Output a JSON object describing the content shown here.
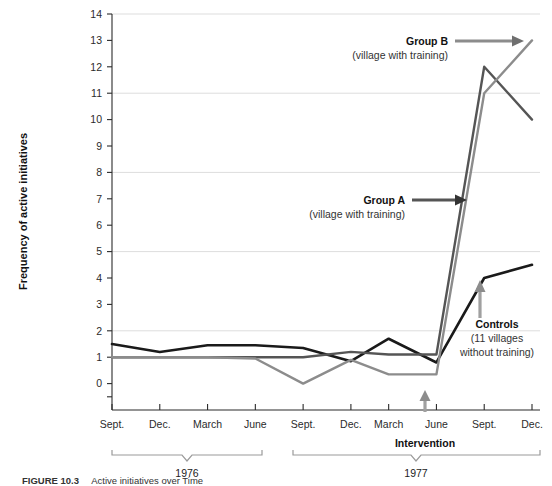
{
  "chart_data": {
    "type": "line",
    "title": "",
    "xlabel": "",
    "ylabel": "Frequency of active initiatives",
    "ylim": [
      -1,
      14
    ],
    "yticks": [
      0,
      1,
      2,
      3,
      4,
      5,
      6,
      7,
      8,
      9,
      10,
      11,
      12,
      13,
      14
    ],
    "gridlines": [
      2,
      5,
      8,
      11,
      14
    ],
    "grid": true,
    "legend_position": "annotations-inline",
    "categories": [
      "Sept.",
      "Dec.",
      "March",
      "June",
      "Sept.",
      "Dec.",
      "March",
      "June",
      "Sept.",
      "Dec."
    ],
    "period_groups": [
      {
        "label": "1976",
        "from_index": 0,
        "to_index": 5
      },
      {
        "label": "1977",
        "from_index": 6,
        "to_index": 9
      }
    ],
    "series": [
      {
        "name": "Controls",
        "sublabel": "(11 villages without training)",
        "color": "#1a1a1a",
        "values": [
          1.5,
          1.2,
          1.45,
          1.45,
          1.35,
          0.85,
          1.7,
          0.8,
          4.0,
          4.5
        ]
      },
      {
        "name": "Group A",
        "sublabel": "(village with training)",
        "color": "#555555",
        "values": [
          1.0,
          1.0,
          1.0,
          1.0,
          1.0,
          1.2,
          1.1,
          1.1,
          12.0,
          10.0
        ]
      },
      {
        "name": "Group B",
        "sublabel": "(village with training)",
        "color": "#8c8c8c",
        "values": [
          1.0,
          1.0,
          1.0,
          0.95,
          0.0,
          0.9,
          0.35,
          0.35,
          11.0,
          13.0
        ]
      }
    ],
    "annotations": [
      {
        "name": "Group B",
        "sub": "(village with training)",
        "arrow": "right",
        "color": "#8c8c8c"
      },
      {
        "name": "Group A",
        "sub": "(village with training)",
        "arrow": "right",
        "color": "#333333"
      },
      {
        "name": "Controls",
        "sub_line1": "(11 villages",
        "sub_line2": "without training)",
        "arrow": "up",
        "color": "#8c8c8c"
      },
      {
        "name": "Intervention",
        "arrow": "up",
        "color": "#8c8c8c",
        "at_index": 7.5
      }
    ]
  },
  "axis": {
    "y_title": "Frequency of active initiatives",
    "y_tick_labels": [
      "14",
      "13",
      "12",
      "11",
      "10",
      "9",
      "8",
      "7",
      "6",
      "5",
      "4",
      "3",
      "2",
      "1",
      "0"
    ],
    "x_tick_labels": [
      "Sept.",
      "Dec.",
      "March",
      "June",
      "Sept.",
      "Dec.",
      "March",
      "June",
      "Sept.",
      "Dec."
    ]
  },
  "annotations": {
    "group_b": {
      "title": "Group B",
      "sub": "(village with training)"
    },
    "group_a": {
      "title": "Group A",
      "sub": "(village with training)"
    },
    "controls": {
      "title": "Controls",
      "sub1": "(11 villages",
      "sub2": "without training)"
    },
    "intervention": {
      "label": "Intervention"
    }
  },
  "year_brackets": {
    "first": "1976",
    "second": "1977"
  },
  "caption": {
    "figure_number": "FIGURE 10.3",
    "text": "Active initiatives over Time"
  }
}
